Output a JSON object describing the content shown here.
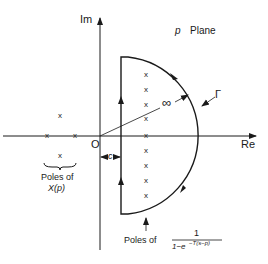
{
  "diagram": {
    "type": "complex-plane contour (Nyquist/Bromwich contour)",
    "plane_label": {
      "symbol": "p",
      "text": "Plane"
    },
    "axes": {
      "imag_label": "Im",
      "real_label": "Re",
      "origin_label": "O"
    },
    "contour_label": "Γ",
    "infinity_label": "∞",
    "offset_label": "c",
    "pole_glyph": "x",
    "left_poles_caption": {
      "line1": "Poles of",
      "line2": "X(p)"
    },
    "right_poles_caption": {
      "prefix": "Poles of",
      "numerator": "1",
      "denominator_base": "1−e",
      "denominator_exponent": "−T(s−p)"
    },
    "colors": {
      "ink": "#1a1a1a",
      "background": "#ffffff"
    }
  }
}
